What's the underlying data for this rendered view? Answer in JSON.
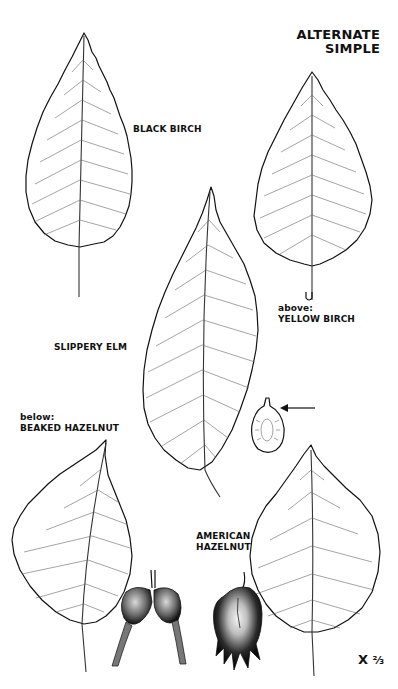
{
  "heading": {
    "line1": "ALTERNATE",
    "line2": "SIMPLE"
  },
  "labels": {
    "black_birch": "BLACK BIRCH",
    "yellow_birch_pre": "above:",
    "yellow_birch": "YELLOW BIRCH",
    "slippery_elm": "SLIPPERY ELM",
    "beaked_hazelnut_pre": "below:",
    "beaked_hazelnut": "BEAKED HAZELNUT",
    "american_hazelnut_1": "AMERICAN",
    "american_hazelnut_2": "HAZELNUT"
  },
  "scale": {
    "prefix": "X",
    "value": "²⁄₃"
  },
  "colors": {
    "ink": "#111111",
    "vein": "#555555",
    "paper": "#ffffff"
  }
}
